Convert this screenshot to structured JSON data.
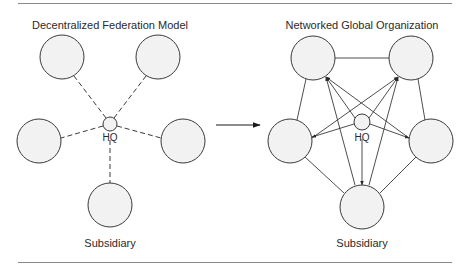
{
  "colors": {
    "stroke": "#3a3a3a",
    "node_fill": "#f2f2f2",
    "rule": "#8a8a8a",
    "text": "#2a2a2a"
  },
  "left_diagram": {
    "title": "Decentralized Federation Model",
    "hq_label": "HQ",
    "subsidiary_label": "Subsidiary",
    "link_style": "dashed",
    "hq": {
      "cx": 110,
      "cy": 124,
      "r": 7
    },
    "nodes": [
      {
        "id": "top-left",
        "cx": 62,
        "cy": 57,
        "r": 22
      },
      {
        "id": "top-right",
        "cx": 158,
        "cy": 57,
        "r": 22
      },
      {
        "id": "left",
        "cx": 39,
        "cy": 141,
        "r": 22
      },
      {
        "id": "right",
        "cx": 183,
        "cy": 141,
        "r": 22
      },
      {
        "id": "bottom",
        "cx": 110,
        "cy": 205,
        "r": 22
      }
    ]
  },
  "right_diagram": {
    "title": "Networked Global Organization",
    "hq_label": "HQ",
    "subsidiary_label": "Subsidiary",
    "link_style": "solid",
    "hq": {
      "cx": 362,
      "cy": 122,
      "r": 8
    },
    "nodes": [
      {
        "id": "top-left",
        "cx": 313,
        "cy": 58,
        "r": 22
      },
      {
        "id": "top-right",
        "cx": 411,
        "cy": 58,
        "r": 22
      },
      {
        "id": "left",
        "cx": 290,
        "cy": 141,
        "r": 22
      },
      {
        "id": "right",
        "cx": 431,
        "cy": 141,
        "r": 22
      },
      {
        "id": "bottom",
        "cx": 362,
        "cy": 207,
        "r": 22
      }
    ]
  },
  "transition_arrow": {
    "x1": 216,
    "y1": 125,
    "x2": 260,
    "y2": 125
  }
}
